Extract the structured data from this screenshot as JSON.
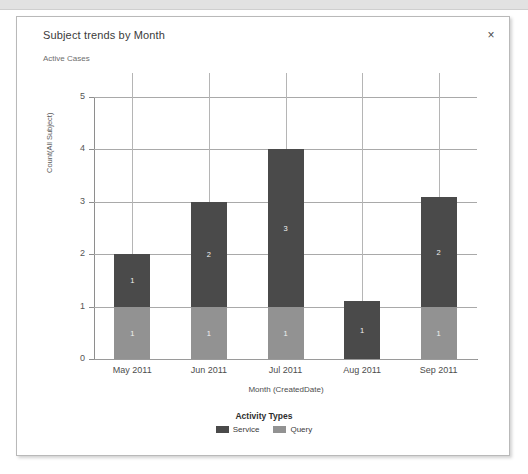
{
  "window": {
    "close_label": "×"
  },
  "panel": {
    "title": "Subject trends by Month",
    "subtitle": "Active Cases"
  },
  "colors": {
    "service": "#4a4a4a",
    "query": "#929292",
    "grid": "#a9a9a9",
    "axis": "#8e8e8e",
    "panel_border": "#b9b9b9",
    "text": "#3b3b3b"
  },
  "chart_data": {
    "type": "bar",
    "title": "Subject trends by Month",
    "subtitle": "Active Cases",
    "stacked": true,
    "categories": [
      "May 2011",
      "Jun 2011",
      "Jul 2011",
      "Aug 2011",
      "Sep 2011"
    ],
    "series": [
      {
        "name": "Query",
        "values": [
          1,
          1,
          1,
          0,
          1
        ],
        "color": "#929292"
      },
      {
        "name": "Service",
        "values": [
          1,
          2,
          3,
          1.1,
          2.1
        ],
        "color": "#4a4a4a"
      }
    ],
    "bar_labels": [
      {
        "category": "May 2011",
        "query": "1",
        "service": "1"
      },
      {
        "category": "Jun 2011",
        "query": "1",
        "service": "2"
      },
      {
        "category": "Jul 2011",
        "query": "1",
        "service": "3"
      },
      {
        "category": "Aug 2011",
        "query": "",
        "service": "1"
      },
      {
        "category": "Sep 2011",
        "query": "1",
        "service": "2"
      }
    ],
    "totals": [
      2,
      3,
      4,
      1.1,
      3.1
    ],
    "xlabel": "Month (CreatedDate)",
    "ylabel": "Count(All Subject)",
    "yticks": [
      "0",
      "1",
      "2",
      "3",
      "4",
      "5"
    ],
    "ylim": [
      0,
      5
    ],
    "grid": true,
    "legend": {
      "title": "Activity Types",
      "position": "bottom",
      "entries": [
        {
          "label": "Service",
          "color": "#4a4a4a"
        },
        {
          "label": "Query",
          "color": "#929292"
        }
      ]
    }
  }
}
